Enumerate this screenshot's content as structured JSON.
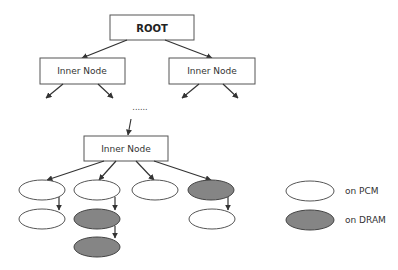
{
  "diagram": {
    "root": {
      "label": "ROOT"
    },
    "inner_nodes": [
      {
        "id": "inner-left",
        "label": "Inner Node"
      },
      {
        "id": "inner-right",
        "label": "Inner Node"
      },
      {
        "id": "inner-bottom",
        "label": "Inner Node"
      }
    ],
    "ellipsis": "......",
    "leaf_nodes": [
      {
        "id": "leaf-1",
        "row": 1,
        "col": 1,
        "storage": "PCM"
      },
      {
        "id": "leaf-2",
        "row": 1,
        "col": 2,
        "storage": "PCM"
      },
      {
        "id": "leaf-3",
        "row": 1,
        "col": 3,
        "storage": "PCM"
      },
      {
        "id": "leaf-4",
        "row": 1,
        "col": 4,
        "storage": "DRAM"
      },
      {
        "id": "leaf-5",
        "row": 2,
        "col": 1,
        "storage": "PCM"
      },
      {
        "id": "leaf-6",
        "row": 2,
        "col": 2,
        "storage": "DRAM"
      },
      {
        "id": "leaf-7",
        "row": 2,
        "col": 4,
        "storage": "PCM"
      },
      {
        "id": "leaf-8",
        "row": 3,
        "col": 2,
        "storage": "DRAM"
      }
    ],
    "colors": {
      "pcm_fill": "#ffffff",
      "dram_fill": "#858585",
      "outline": "#555555"
    }
  },
  "legend": {
    "items": [
      {
        "label": "on PCM",
        "fill": "#ffffff"
      },
      {
        "label": "on DRAM",
        "fill": "#858585"
      }
    ]
  }
}
